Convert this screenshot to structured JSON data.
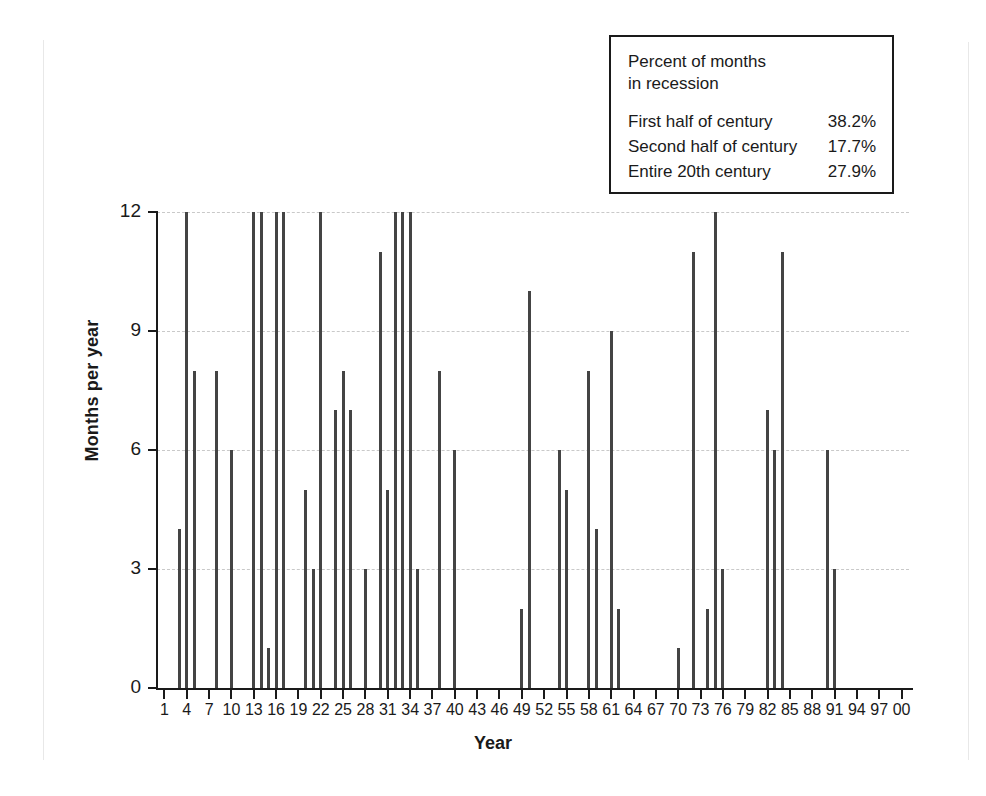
{
  "stats_box": {
    "title": "Percent of months\nin recession",
    "rows": [
      {
        "label": "First half of century",
        "value": "38.2%"
      },
      {
        "label": "Second half of century",
        "value": "17.7%"
      },
      {
        "label": "Entire 20th century",
        "value": "27.9%"
      }
    ]
  },
  "chart_data": {
    "type": "bar",
    "title": "",
    "xlabel": "Year",
    "ylabel": "Months per year",
    "xlim": [
      0,
      101
    ],
    "ylim": [
      0,
      12
    ],
    "grid": true,
    "legend_position": "top-right",
    "bar_color": "#444444",
    "gridline_color": "#c9c9c9",
    "axis_color": "#1a1a1a",
    "y_ticks": [
      0,
      3,
      6,
      9,
      12
    ],
    "x_ticks": [
      1,
      4,
      7,
      10,
      13,
      16,
      19,
      22,
      25,
      28,
      31,
      34,
      37,
      40,
      43,
      46,
      49,
      52,
      55,
      58,
      61,
      64,
      67,
      70,
      73,
      76,
      79,
      82,
      85,
      88,
      91,
      94,
      97,
      100
    ],
    "x_tick_labels": [
      "1",
      "4",
      "7",
      "10",
      "13",
      "16",
      "19",
      "22",
      "25",
      "28",
      "31",
      "34",
      "37",
      "40",
      "43",
      "46",
      "49",
      "52",
      "55",
      "58",
      "61",
      "64",
      "67",
      "70",
      "73",
      "76",
      "79",
      "82",
      "85",
      "88",
      "91",
      "94",
      "97",
      "00"
    ],
    "categories": [
      1,
      2,
      3,
      4,
      5,
      6,
      7,
      8,
      9,
      10,
      11,
      12,
      13,
      14,
      15,
      16,
      17,
      18,
      19,
      20,
      21,
      22,
      23,
      24,
      25,
      26,
      27,
      28,
      29,
      30,
      31,
      32,
      33,
      34,
      35,
      36,
      37,
      38,
      39,
      40,
      41,
      42,
      43,
      44,
      45,
      46,
      47,
      48,
      49,
      50,
      51,
      52,
      53,
      54,
      55,
      56,
      57,
      58,
      59,
      60,
      61,
      62,
      63,
      64,
      65,
      66,
      67,
      68,
      69,
      70,
      71,
      72,
      73,
      74,
      75,
      76,
      77,
      78,
      79,
      80,
      81,
      82,
      83,
      84,
      85,
      86,
      87,
      88,
      89,
      90,
      91,
      92,
      93,
      94,
      95,
      96,
      97,
      98,
      99,
      100
    ],
    "values": [
      0,
      0,
      4,
      12,
      8,
      0,
      0,
      8,
      0,
      6,
      0,
      0,
      12,
      12,
      1,
      12,
      12,
      0,
      0,
      5,
      3,
      12,
      0,
      7,
      8,
      7,
      0,
      3,
      0,
      11,
      5,
      12,
      12,
      12,
      3,
      0,
      0,
      8,
      0,
      6,
      0,
      0,
      0,
      0,
      0,
      0,
      0,
      0,
      2,
      10,
      0,
      0,
      0,
      6,
      5,
      0,
      0,
      8,
      4,
      0,
      9,
      2,
      0,
      0,
      0,
      0,
      0,
      0,
      0,
      1,
      0,
      11,
      0,
      2,
      12,
      3,
      0,
      0,
      0,
      0,
      0,
      7,
      6,
      11,
      0,
      0,
      0,
      0,
      0,
      6,
      3,
      0,
      0,
      0,
      0,
      0,
      0,
      0,
      0,
      0
    ]
  }
}
